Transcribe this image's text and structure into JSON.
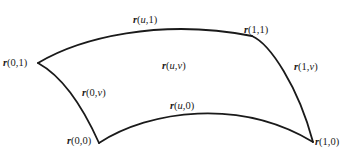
{
  "diagram": {
    "stroke_color": "#1a1a1a",
    "background_color": "#ffffff",
    "corners": {
      "r00": {
        "label_fn": "r",
        "args": "(0,0)",
        "point": [
          99,
          143
        ]
      },
      "r01": {
        "label_fn": "r",
        "args": "(0,1)",
        "point": [
          38,
          63
        ]
      },
      "r10": {
        "label_fn": "r",
        "args": "(1,0)",
        "point": [
          313,
          142
        ]
      },
      "r11": {
        "label_fn": "r",
        "args": "(1,1)",
        "point": [
          252,
          36
        ]
      }
    },
    "edges": {
      "r0v": {
        "label_fn": "r",
        "args_pre": "(0,",
        "var": "v",
        "args_post": ")"
      },
      "r1v": {
        "label_fn": "r",
        "args_pre": "(1,",
        "var": "v",
        "args_post": ")"
      },
      "ru0": {
        "label_fn": "r",
        "args_pre": "(",
        "var": "u",
        "args_post": ",0)"
      },
      "ru1": {
        "label_fn": "r",
        "args_pre": "(",
        "var": "u",
        "args_post": ",1)"
      }
    },
    "interior": {
      "ruv": {
        "label_fn": "r",
        "args_pre": "(",
        "var1": "u",
        "sep": ",",
        "var2": "v",
        "args_post": ")"
      }
    }
  }
}
